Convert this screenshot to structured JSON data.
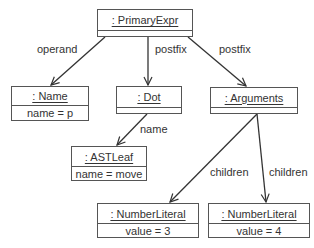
{
  "diagram": {
    "type": "UML object diagram",
    "objects": [
      {
        "id": "primary",
        "title": ": PrimaryExpr",
        "attribute": ""
      },
      {
        "id": "name",
        "title": ": Name",
        "attribute": "name = p"
      },
      {
        "id": "dot",
        "title": ": Dot",
        "attribute": ""
      },
      {
        "id": "arguments",
        "title": ": Arguments",
        "attribute": ""
      },
      {
        "id": "astleaf",
        "title": ": ASTLeaf",
        "attribute": "name = move"
      },
      {
        "id": "num3",
        "title": ": NumberLiteral",
        "attribute": "value = 3"
      },
      {
        "id": "num4",
        "title": ": NumberLiteral",
        "attribute": "value = 4"
      }
    ],
    "links": [
      {
        "from": "primary",
        "to": "name",
        "label": "operand"
      },
      {
        "from": "primary",
        "to": "dot",
        "label": "postfix"
      },
      {
        "from": "primary",
        "to": "arguments",
        "label": "postfix"
      },
      {
        "from": "dot",
        "to": "astleaf",
        "label": "name"
      },
      {
        "from": "arguments",
        "to": "num3",
        "label": "children"
      },
      {
        "from": "arguments",
        "to": "num4",
        "label": "children"
      }
    ],
    "colors": {
      "line": "#333333",
      "border": "#555555",
      "text": "#333333"
    }
  }
}
